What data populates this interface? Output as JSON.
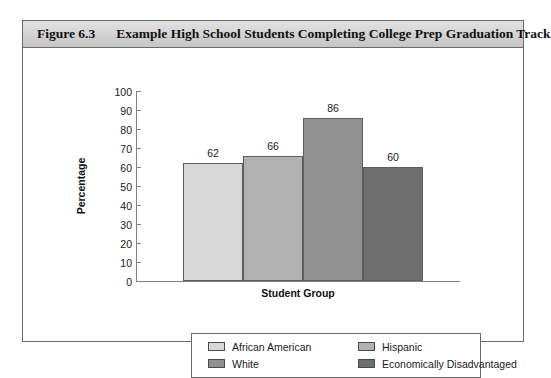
{
  "figure": {
    "number": "Figure 6.3",
    "title": "Example High School Students Completing College Prep Graduation Track"
  },
  "chart_data": {
    "type": "bar",
    "title": "Example High School Students Completing College Prep Graduation Track",
    "xlabel": "Student Group",
    "ylabel": "Percentage",
    "categories": [
      "African American",
      "Hispanic",
      "White",
      "Economically Disadvantaged"
    ],
    "values": [
      62,
      66,
      86,
      60
    ],
    "ylim": [
      0,
      100
    ],
    "yticks": [
      0,
      10,
      20,
      30,
      40,
      50,
      60,
      70,
      80,
      90,
      100
    ],
    "ytick_labels": [
      "0",
      "10",
      "20",
      "30",
      "40",
      "50",
      "60",
      "70",
      "80",
      "90",
      "100"
    ],
    "grid": false,
    "legend_position": "bottom",
    "series_colors": [
      "#d8d8d8",
      "#b2b2b2",
      "#919191",
      "#6e6e6e"
    ],
    "value_labels": [
      "62",
      "66",
      "86",
      "60"
    ]
  },
  "legend": {
    "rows": [
      [
        {
          "label": "African American",
          "color": "#d8d8d8"
        },
        {
          "label": "Hispanic",
          "color": "#b2b2b2"
        }
      ],
      [
        {
          "label": "White",
          "color": "#919191"
        },
        {
          "label": "Economically Disadvantaged",
          "color": "#6e6e6e"
        }
      ]
    ]
  }
}
